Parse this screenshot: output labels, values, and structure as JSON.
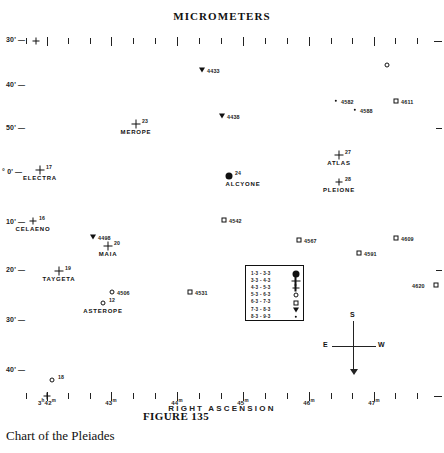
{
  "figure": {
    "top_title": "MICROMETERS",
    "figure_number": "FIGURE 135",
    "caption": "Chart of the Pleiades"
  },
  "axes": {
    "x_title": "RIGHT ASCENSION",
    "x_ticks": [
      {
        "label": "3",
        "sup1": "h",
        "label2": "42",
        "sup2": "m",
        "x": 47
      },
      {
        "label": "",
        "sup1": "",
        "label2": "43",
        "sup2": "m",
        "x": 111
      },
      {
        "label": "",
        "sup1": "",
        "label2": "44",
        "sup2": "m",
        "x": 177
      },
      {
        "label": "",
        "sup1": "",
        "label2": "45",
        "sup2": "m",
        "x": 243
      },
      {
        "label": "",
        "sup1": "",
        "label2": "46",
        "sup2": "m",
        "x": 309
      },
      {
        "label": "",
        "sup1": "",
        "label2": "47",
        "sup2": "m",
        "x": 374
      }
    ],
    "y_labels": [
      {
        "text": "30'",
        "y": 40
      },
      {
        "text": "40'",
        "y": 85
      },
      {
        "text": "50'",
        "y": 128
      },
      {
        "text": "0'",
        "y": 172,
        "prefix": "°"
      },
      {
        "text": "10'",
        "y": 222
      },
      {
        "text": "20'",
        "y": 270
      },
      {
        "text": "30'",
        "y": 320
      },
      {
        "text": "40'",
        "y": 370
      }
    ]
  },
  "legend": {
    "rows": [
      {
        "range": "1·3 - 3·3",
        "symbol": "filled-large-disc"
      },
      {
        "range": "3·3 - 4·3",
        "symbol": "cross"
      },
      {
        "range": "4·3 - 5·3",
        "symbol": "small-cross"
      },
      {
        "range": "5·3 - 6·3",
        "symbol": "open-circle"
      },
      {
        "range": "6·3 - 7·3",
        "symbol": "open-square"
      },
      {
        "range": "7·3 - 8·3",
        "symbol": "triangle"
      },
      {
        "range": "8·3 - 9·3",
        "symbol": "dot"
      }
    ]
  },
  "compass": {
    "north_label": "S",
    "west_label": "E",
    "east_label": "W"
  },
  "chart_data": {
    "type": "scatter",
    "title": "Chart of the Pleiades",
    "subtitle": "MICROMETERS",
    "xlabel": "RIGHT ASCENSION",
    "ylabel": "DECLINATION",
    "xlim": [
      "3h41m",
      "3h47m30s"
    ],
    "ylim": [
      "23°25'",
      "24°45'"
    ],
    "grid": false,
    "legend_position": "inside-center-right",
    "magnitude_bands": [
      "1·3 - 3·3",
      "3·3 - 4·3",
      "4·3 - 5·3",
      "5·3 - 6·3",
      "6·3 - 7·3",
      "7·3 - 8·3",
      "8·3 - 9·3"
    ],
    "stars": [
      {
        "name": "",
        "num": "",
        "cat": "4433",
        "marker": "triangle",
        "x": 202,
        "y": 70,
        "label_pos": "right"
      },
      {
        "name": "",
        "num": "",
        "cat": "",
        "marker": "open-circle",
        "x": 387,
        "y": 65,
        "label_pos": "right"
      },
      {
        "name": "",
        "num": "",
        "cat": "4582",
        "marker": "dot",
        "x": 336,
        "y": 101,
        "label_pos": "right"
      },
      {
        "name": "",
        "num": "",
        "cat": "4588",
        "marker": "dot",
        "x": 355,
        "y": 110,
        "label_pos": "right"
      },
      {
        "name": "",
        "num": "",
        "cat": "4611",
        "marker": "open-square",
        "x": 396,
        "y": 101,
        "label_pos": "right"
      },
      {
        "name": "",
        "num": "",
        "cat": "4438",
        "marker": "triangle",
        "x": 222,
        "y": 116,
        "label_pos": "right"
      },
      {
        "name": "MEROPE",
        "num": "23",
        "cat": "",
        "marker": "cross",
        "x": 136,
        "y": 124,
        "label_pos": "below"
      },
      {
        "name": "ATLAS",
        "num": "27",
        "cat": "",
        "marker": "cross",
        "x": 339,
        "y": 155,
        "label_pos": "below"
      },
      {
        "name": "ELECTRA",
        "num": "17",
        "cat": "",
        "marker": "cross",
        "x": 40,
        "y": 170,
        "label_pos": "below"
      },
      {
        "name": "ALCYONE",
        "num": "24",
        "cat": "",
        "marker": "filled-large-disc",
        "x": 229,
        "y": 176,
        "label_pos": "below-right"
      },
      {
        "name": "PLEIONE",
        "num": "28",
        "cat": "",
        "marker": "small-cross",
        "x": 339,
        "y": 182,
        "label_pos": "below"
      },
      {
        "name": "CELAENO",
        "num": "16",
        "cat": "",
        "marker": "small-cross",
        "x": 33,
        "y": 221,
        "label_pos": "below"
      },
      {
        "name": "",
        "num": "",
        "cat": "4542",
        "marker": "open-square",
        "x": 224,
        "y": 220,
        "label_pos": "right"
      },
      {
        "name": "",
        "num": "",
        "cat": "4498",
        "marker": "triangle",
        "x": 93,
        "y": 237,
        "label_pos": "right"
      },
      {
        "name": "",
        "num": "",
        "cat": "4567",
        "marker": "open-square",
        "x": 299,
        "y": 240,
        "label_pos": "right"
      },
      {
        "name": "",
        "num": "",
        "cat": "4609",
        "marker": "open-square",
        "x": 396,
        "y": 238,
        "label_pos": "right"
      },
      {
        "name": "MAIA",
        "num": "20",
        "cat": "",
        "marker": "cross",
        "x": 108,
        "y": 246,
        "label_pos": "below"
      },
      {
        "name": "",
        "num": "",
        "cat": "4591",
        "marker": "open-square",
        "x": 359,
        "y": 253,
        "label_pos": "right"
      },
      {
        "name": "TAYGETA",
        "num": "19",
        "cat": "",
        "marker": "cross",
        "x": 59,
        "y": 271,
        "label_pos": "below"
      },
      {
        "name": "",
        "num": "",
        "cat": "4531",
        "marker": "open-square",
        "x": 190,
        "y": 292,
        "label_pos": "right"
      },
      {
        "name": "",
        "num": "",
        "cat": "4506",
        "marker": "open-circle",
        "x": 112,
        "y": 292,
        "label_pos": "right"
      },
      {
        "name": "",
        "num": "",
        "cat": "4620",
        "marker": "open-square",
        "x": 436,
        "y": 285,
        "label_pos": "left"
      },
      {
        "name": "ASTEROPE",
        "num": "12",
        "cat": "",
        "marker": "open-circle",
        "x": 103,
        "y": 303,
        "label_pos": "below"
      },
      {
        "name": "",
        "num": "18",
        "cat": "",
        "marker": "open-circle",
        "x": 52,
        "y": 380,
        "label_pos": "right"
      }
    ]
  }
}
